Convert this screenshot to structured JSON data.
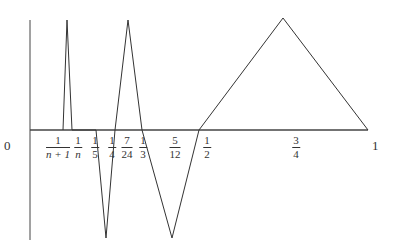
{
  "diagram": {
    "type": "piecewise-linear function graph (sawtooth spikes)",
    "origin_label": "0",
    "end_label": "1",
    "axes": {
      "x_axis": {
        "y": 130,
        "x_from": 30,
        "x_to": 368
      },
      "y_axis": {
        "x": 30,
        "y_from": 20,
        "y_to": 240
      }
    },
    "tick_labels": [
      {
        "id": "1-over-n-plus-1",
        "num": "1",
        "den": "n+1",
        "x": 58
      },
      {
        "id": "1-over-n",
        "num": "1",
        "den": "n",
        "x": 78
      },
      {
        "id": "1-over-5",
        "num": "1",
        "den": "5",
        "x": 95
      },
      {
        "id": "1-over-4",
        "num": "1",
        "den": "4",
        "x": 112
      },
      {
        "id": "7-over-24",
        "num": "7",
        "den": "24",
        "x": 127
      },
      {
        "id": "1-over-3",
        "num": "1",
        "den": "3",
        "x": 143
      },
      {
        "id": "5-over-12",
        "num": "5",
        "den": "12",
        "x": 175
      },
      {
        "id": "1-over-2",
        "num": "1",
        "den": "2",
        "x": 207
      },
      {
        "id": "3-over-4",
        "num": "3",
        "den": "4",
        "x": 296
      }
    ],
    "curve_points": [
      [
        63,
        130
      ],
      [
        67,
        20
      ],
      [
        72,
        130
      ],
      [
        96,
        130
      ],
      [
        106,
        238
      ],
      [
        115,
        130
      ],
      [
        128,
        20
      ],
      [
        142,
        130
      ],
      [
        172,
        238
      ],
      [
        199,
        130
      ],
      [
        283,
        18
      ],
      [
        368,
        130
      ]
    ],
    "colors": {
      "line": "#333333",
      "axis": "#444444",
      "background": "#ffffff"
    }
  }
}
